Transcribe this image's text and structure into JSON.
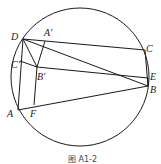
{
  "figure": {
    "caption": "图 A1-2",
    "circle": {
      "cx": 80,
      "cy": 77,
      "r": 69
    },
    "points": {
      "D": {
        "label": "D",
        "x": 23,
        "y": 39
      },
      "A'": {
        "label": "A'",
        "x": 45,
        "y": 41
      },
      "C": {
        "label": "C",
        "x": 145,
        "y": 50
      },
      "C'": {
        "label": "C'",
        "x": 20,
        "y": 61
      },
      "B'": {
        "label": "B'",
        "x": 37,
        "y": 67
      },
      "E": {
        "label": "E",
        "x": 148,
        "y": 78
      },
      "B": {
        "label": "B",
        "x": 148,
        "y": 86
      },
      "A": {
        "label": "A",
        "x": 18,
        "y": 110
      },
      "F": {
        "label": "F",
        "x": 34,
        "y": 105
      }
    },
    "labels": {
      "D": "D",
      "A_prime": "A'",
      "C": "C",
      "C_prime": "C'",
      "B_prime": "B'",
      "E": "E",
      "B": "B",
      "A": "A",
      "F": "F"
    },
    "segments": [
      [
        "D",
        "C"
      ],
      [
        "D",
        "B"
      ],
      [
        "D",
        "A"
      ],
      [
        "D",
        "B'"
      ],
      [
        "A'",
        "B'"
      ],
      [
        "B'",
        "F"
      ],
      [
        "C'",
        "E"
      ],
      [
        "A",
        "B"
      ],
      [
        "C",
        "B"
      ],
      [
        "D",
        "A'"
      ]
    ]
  }
}
